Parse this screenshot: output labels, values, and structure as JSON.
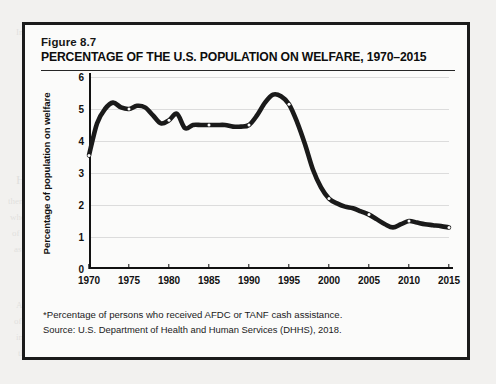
{
  "figure": {
    "number": "Figure 8.7",
    "title": "PERCENTAGE OF THE U.S. POPULATION ON WELFARE, 1970–2015",
    "footnote": "*Percentage of persons who received AFDC or TANF cash assistance.",
    "source": "Source:  U.S. Department of Health and Human Services (DHHS), 2018."
  },
  "chart_data": {
    "type": "line",
    "title": "PERCENTAGE OF THE U.S. POPULATION ON WELFARE, 1970–2015",
    "xlabel": "",
    "ylabel": "Percentage of population on welfare",
    "xlim": [
      1970,
      2015
    ],
    "ylim": [
      0,
      6
    ],
    "grid": true,
    "legend": "none",
    "line_color": "#1a1a1a",
    "marker_color": "#ffffff",
    "xticks": [
      1970,
      1975,
      1980,
      1985,
      1990,
      1995,
      2000,
      2005,
      2010,
      2015
    ],
    "xtick_labels": [
      "1970",
      "1975",
      "1980",
      "1985",
      "1990",
      "1995",
      "2000",
      "2005",
      "2010",
      "2015"
    ],
    "yticks": [
      0,
      1,
      2,
      3,
      4,
      5,
      6
    ],
    "ytick_labels": [
      "0",
      "1",
      "2",
      "3",
      "4",
      "5",
      "6"
    ],
    "marker_years": [
      1970,
      1975,
      1980,
      1985,
      1990,
      1995,
      2000,
      2005,
      2010,
      2015
    ],
    "x": [
      1970,
      1971,
      1972,
      1973,
      1974,
      1975,
      1976,
      1977,
      1978,
      1979,
      1980,
      1981,
      1982,
      1983,
      1984,
      1985,
      1986,
      1987,
      1988,
      1989,
      1990,
      1991,
      1992,
      1993,
      1994,
      1995,
      1996,
      1997,
      1998,
      1999,
      2000,
      2001,
      2002,
      2003,
      2004,
      2005,
      2006,
      2007,
      2008,
      2009,
      2010,
      2011,
      2012,
      2013,
      2014,
      2015
    ],
    "values": [
      3.55,
      4.55,
      5.0,
      5.2,
      5.05,
      5.0,
      5.1,
      5.05,
      4.8,
      4.55,
      4.65,
      4.85,
      4.4,
      4.5,
      4.5,
      4.5,
      4.5,
      4.5,
      4.45,
      4.45,
      4.5,
      4.8,
      5.2,
      5.45,
      5.4,
      5.15,
      4.6,
      3.9,
      3.1,
      2.55,
      2.2,
      2.05,
      1.95,
      1.9,
      1.8,
      1.7,
      1.55,
      1.4,
      1.3,
      1.4,
      1.5,
      1.45,
      1.4,
      1.37,
      1.34,
      1.3
    ]
  },
  "ghost_page": [
    {
      "t": "In addition, their standard of living decreased from previous",
      "x": 16,
      "y": 27,
      "s": 9
    },
    {
      "t": "themselves better off in the depressed labor markets that will re-emerge",
      "x": 8,
      "y": 196,
      "s": 9
    },
    {
      "t": "when, in another recession or downturn, workers face a tightening",
      "x": 10,
      "y": 212,
      "s": 9
    },
    {
      "t": "of their positions. In the future, we may see a shift in the labor market",
      "x": 12,
      "y": 228,
      "s": 9
    },
    {
      "t": "as people looking at these questions have begun to note.",
      "x": 14,
      "y": 244,
      "s": 9
    },
    {
      "t": "How Will These Economic Patterns Affect Your Life?",
      "x": 16,
      "y": 172,
      "s": 13
    },
    {
      "t": "As a result of these trends, will people in the United States",
      "x": 16,
      "y": 300,
      "s": 9
    },
    {
      "t": "of the recent decades be replaced, and how will we find ourselves",
      "x": 14,
      "y": 316,
      "s": 9
    },
    {
      "t": "in a position to adapt to the changing labor market conditions",
      "x": 16,
      "y": 332,
      "s": 9
    },
    {
      "t": "that will likely shape the beginning of the next decade?",
      "x": 18,
      "y": 348,
      "s": 9
    }
  ]
}
